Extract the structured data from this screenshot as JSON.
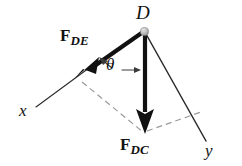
{
  "figure": {
    "background_color": "#ffffff",
    "stroke_color": "#111111",
    "dash_color": "#9a9a9a",
    "node_color": "#b8b8b8",
    "width": 242,
    "height": 166
  },
  "labels": {
    "point_d": "D",
    "axis_x": "x",
    "axis_y": "y",
    "angle_theta": "θ",
    "force_de_main": "F",
    "force_de_sub": "DE",
    "force_dc_main": "F",
    "force_dc_sub": "DC"
  },
  "geometry": {
    "origin": {
      "x": 144,
      "y": 31
    },
    "force_de_tip": {
      "x": 76,
      "y": 78
    },
    "force_dc_tip": {
      "x": 145,
      "y": 133
    },
    "axis_x_end": {
      "x": 36,
      "y": 107
    },
    "axis_y_end": {
      "x": 206,
      "y": 141
    },
    "dash_right_end": {
      "x": 201,
      "y": 112
    }
  }
}
